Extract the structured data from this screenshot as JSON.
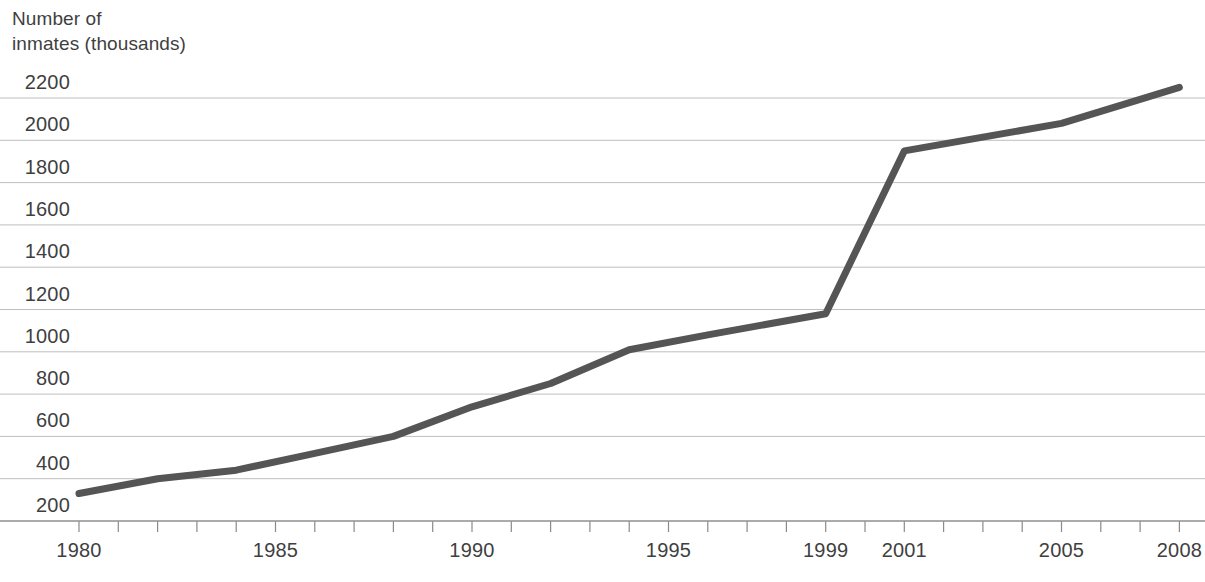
{
  "chart_data": {
    "type": "line",
    "title": "",
    "subtitle": "",
    "ylabel": "Number of\ninmates (thousands)",
    "xlabel": "",
    "x": [
      1980,
      1982,
      1984,
      1986,
      1988,
      1990,
      1992,
      1994,
      1996,
      1999,
      2001,
      2005,
      2008
    ],
    "values": [
      330,
      400,
      440,
      520,
      600,
      740,
      850,
      1010,
      1080,
      1180,
      1950,
      2080,
      2250
    ],
    "series": [
      {
        "name": "Number of inmates (thousands)",
        "color": "#555555",
        "points": [
          {
            "x": 1980,
            "y": 330
          },
          {
            "x": 1982,
            "y": 400
          },
          {
            "x": 1984,
            "y": 440
          },
          {
            "x": 1986,
            "y": 520
          },
          {
            "x": 1988,
            "y": 600
          },
          {
            "x": 1990,
            "y": 740
          },
          {
            "x": 1992,
            "y": 850
          },
          {
            "x": 1994,
            "y": 1010
          },
          {
            "x": 1996,
            "y": 1080
          },
          {
            "x": 1999,
            "y": 1180
          },
          {
            "x": 2001,
            "y": 1950
          },
          {
            "x": 2005,
            "y": 2080
          },
          {
            "x": 2008,
            "y": 2250
          }
        ]
      }
    ],
    "ylim": [
      200,
      2250
    ],
    "xlim": [
      1980,
      2008
    ],
    "yticks": [
      200,
      400,
      600,
      800,
      1000,
      1200,
      1400,
      1600,
      1800,
      2000,
      2200
    ],
    "ytick_labels": [
      "200",
      "400",
      "600",
      "800",
      "1000",
      "1200",
      "1400",
      "1600",
      "1800",
      "2000",
      "2200"
    ],
    "xticks": [
      1980,
      1985,
      1990,
      1995,
      1999,
      2001,
      2005,
      2008
    ],
    "xtick_labels": [
      "1980",
      "1985",
      "1990",
      "1995",
      "1999",
      "2001",
      "2005",
      "2008"
    ],
    "xtick_minor_every": 1,
    "grid": {
      "horizontal": true,
      "vertical": false,
      "color": "#bfbfbf"
    },
    "legend": {
      "visible": false,
      "position": "none"
    },
    "axis_color": "#8a8a8a",
    "line_color": "#555555",
    "line_width": 7,
    "background": "#ffffff"
  },
  "geometry": {
    "plot_left": 79,
    "plot_right": 1197,
    "baseline_y": 521,
    "gridline_top_y": 98,
    "px_per_year": 39.3,
    "px_per_200": 42.3
  }
}
